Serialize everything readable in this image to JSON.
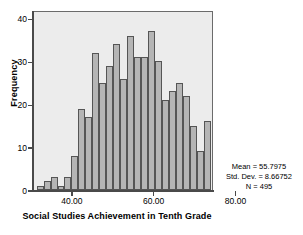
{
  "chart_data": {
    "type": "bar",
    "title": "",
    "xlabel": "Social Studies Achievement in Tenth Grade",
    "ylabel": "Frequency",
    "xlim": [
      30.5,
      74.5
    ],
    "ylim": [
      0,
      42
    ],
    "grid": false,
    "legend": null,
    "bin_width": 1.7,
    "x_ticks": [
      {
        "value": 40,
        "label": "40.00"
      },
      {
        "value": 60,
        "label": "60.00"
      },
      {
        "value": 80,
        "label": "80.00"
      }
    ],
    "y_ticks": [
      {
        "value": 0,
        "label": "0"
      },
      {
        "value": 10,
        "label": "10"
      },
      {
        "value": 20,
        "label": "20"
      },
      {
        "value": 30,
        "label": "30"
      },
      {
        "value": 40,
        "label": "40"
      }
    ],
    "bins": [
      {
        "center": 32.0,
        "value": 1
      },
      {
        "center": 33.7,
        "value": 2
      },
      {
        "center": 35.4,
        "value": 3
      },
      {
        "center": 37.1,
        "value": 1
      },
      {
        "center": 38.8,
        "value": 3
      },
      {
        "center": 40.5,
        "value": 8
      },
      {
        "center": 42.2,
        "value": 19
      },
      {
        "center": 43.9,
        "value": 17
      },
      {
        "center": 45.6,
        "value": 32
      },
      {
        "center": 47.3,
        "value": 25
      },
      {
        "center": 49.0,
        "value": 29
      },
      {
        "center": 50.7,
        "value": 34
      },
      {
        "center": 52.4,
        "value": 26
      },
      {
        "center": 54.1,
        "value": 36
      },
      {
        "center": 55.8,
        "value": 31
      },
      {
        "center": 57.5,
        "value": 31
      },
      {
        "center": 59.2,
        "value": 37
      },
      {
        "center": 60.9,
        "value": 30
      },
      {
        "center": 62.6,
        "value": 21
      },
      {
        "center": 64.3,
        "value": 23
      },
      {
        "center": 66.0,
        "value": 25
      },
      {
        "center": 67.7,
        "value": 22
      },
      {
        "center": 69.4,
        "value": 15
      },
      {
        "center": 71.1,
        "value": 9
      },
      {
        "center": 72.8,
        "value": 16
      }
    ],
    "values": [
      1,
      2,
      3,
      1,
      3,
      8,
      19,
      17,
      32,
      25,
      29,
      34,
      26,
      36,
      31,
      31,
      37,
      30,
      21,
      23,
      25,
      22,
      15,
      9,
      16
    ],
    "categories": [
      "32.0",
      "33.7",
      "35.4",
      "37.1",
      "38.8",
      "40.5",
      "42.2",
      "43.9",
      "45.6",
      "47.3",
      "49.0",
      "50.7",
      "52.4",
      "54.1",
      "55.8",
      "57.5",
      "59.2",
      "60.9",
      "62.6",
      "64.3",
      "66.0",
      "67.7",
      "69.4",
      "71.1",
      "72.8"
    ],
    "colors": {
      "bar_fill": "#b5b5b5",
      "bar_edge": "#555555",
      "plot_background": "#ececec",
      "axis": "#4a4a4a",
      "text": "#000000",
      "page_background": "#ffffff"
    }
  },
  "axes": {
    "y_title": "Frequency",
    "x_title": "Social Studies Achievement in Tenth Grade"
  },
  "statistics": {
    "mean_line": "Mean = 55.7975",
    "std_dev_line": "Std. Dev. = 8.66752",
    "n_line": "N = 495",
    "mean_value": 55.7975,
    "std_dev_value": 8.66752,
    "n_value": 495
  }
}
